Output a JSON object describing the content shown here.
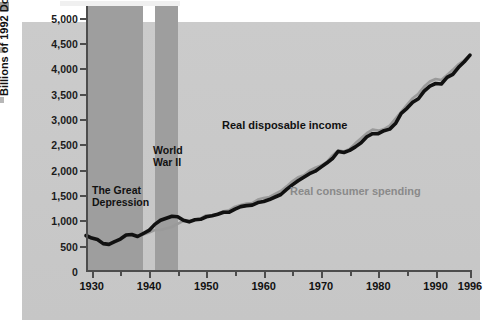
{
  "chart_data": {
    "type": "line",
    "title": "",
    "xlabel": "",
    "ylabel": "Billions of 1992 Dollars",
    "xlim": [
      1929,
      1996
    ],
    "ylim": [
      0,
      5250
    ],
    "grid": false,
    "legend_position": "inline-annotations",
    "y_ticks": [
      "0",
      "500",
      "1,000",
      "1,500",
      "2,000",
      "2,500",
      "3,000",
      "3,500",
      "4,000",
      "4,500",
      "5,000"
    ],
    "y_tick_values": [
      0,
      500,
      1000,
      1500,
      2000,
      2500,
      3000,
      3500,
      4000,
      4500,
      5000
    ],
    "x_ticks": [
      "1930",
      "1940",
      "1950",
      "1960",
      "1970",
      "1980",
      "1990",
      "1996"
    ],
    "x_tick_values": [
      1930,
      1940,
      1950,
      1960,
      1970,
      1980,
      1990,
      1996
    ],
    "x_minor_tick_values": [
      1935,
      1945,
      1955,
      1965,
      1975,
      1985
    ],
    "shaded_regions": [
      {
        "label": "The Great Depression",
        "start": 1929,
        "end": 1939,
        "color": "#9e9e9e"
      },
      {
        "label": "World War II",
        "start": 1941,
        "end": 1945,
        "color": "#9e9e9e"
      }
    ],
    "annotations": [
      {
        "text": "The Great\nDepression",
        "series": null
      },
      {
        "text": "World\nWar II",
        "series": null
      },
      {
        "text": "Real disposable income",
        "series": "Real disposable income"
      },
      {
        "text": "Real consumer spending",
        "series": "Real consumer spending"
      }
    ],
    "series": [
      {
        "name": "Real disposable income",
        "color": "#111111",
        "x": [
          1929,
          1930,
          1931,
          1932,
          1933,
          1934,
          1935,
          1936,
          1937,
          1938,
          1939,
          1940,
          1941,
          1942,
          1943,
          1944,
          1945,
          1946,
          1947,
          1948,
          1949,
          1950,
          1951,
          1952,
          1953,
          1954,
          1955,
          1956,
          1957,
          1958,
          1959,
          1960,
          1961,
          1962,
          1963,
          1964,
          1965,
          1966,
          1967,
          1968,
          1969,
          1970,
          1971,
          1972,
          1973,
          1974,
          1975,
          1976,
          1977,
          1978,
          1979,
          1980,
          1981,
          1982,
          1983,
          1984,
          1985,
          1986,
          1987,
          1988,
          1989,
          1990,
          1991,
          1992,
          1993,
          1994,
          1995,
          1996
        ],
        "y": [
          720,
          670,
          640,
          560,
          545,
          600,
          650,
          730,
          740,
          700,
          760,
          820,
          940,
          1020,
          1060,
          1100,
          1090,
          1020,
          990,
          1030,
          1040,
          1090,
          1110,
          1140,
          1180,
          1180,
          1240,
          1290,
          1310,
          1320,
          1370,
          1390,
          1430,
          1480,
          1530,
          1630,
          1720,
          1800,
          1870,
          1940,
          1990,
          2070,
          2150,
          2240,
          2380,
          2360,
          2400,
          2470,
          2550,
          2670,
          2730,
          2730,
          2790,
          2820,
          2930,
          3130,
          3230,
          3350,
          3420,
          3570,
          3670,
          3720,
          3710,
          3840,
          3900,
          4040,
          4150,
          4280
        ]
      },
      {
        "name": "Real consumer spending",
        "color": "#9a9a9a",
        "x": [
          1929,
          1930,
          1931,
          1932,
          1933,
          1934,
          1935,
          1936,
          1937,
          1938,
          1939,
          1940,
          1941,
          1942,
          1943,
          1944,
          1945,
          1946,
          1947,
          1948,
          1949,
          1950,
          1951,
          1952,
          1953,
          1954,
          1955,
          1956,
          1957,
          1958,
          1959,
          1960,
          1961,
          1962,
          1963,
          1964,
          1965,
          1966,
          1967,
          1968,
          1969,
          1970,
          1971,
          1972,
          1973,
          1974,
          1975,
          1976,
          1977,
          1978,
          1979,
          1980,
          1981,
          1982,
          1983,
          1984,
          1985,
          1986,
          1987,
          1988,
          1989,
          1990,
          1991,
          1992,
          1993,
          1994,
          1995,
          1996
        ],
        "y": [
          700,
          660,
          630,
          560,
          550,
          590,
          630,
          700,
          720,
          700,
          740,
          780,
          830,
          830,
          860,
          890,
          950,
          1010,
          1010,
          1030,
          1060,
          1120,
          1120,
          1150,
          1200,
          1220,
          1290,
          1320,
          1350,
          1360,
          1430,
          1460,
          1480,
          1540,
          1600,
          1690,
          1790,
          1870,
          1910,
          2000,
          2060,
          2100,
          2170,
          2300,
          2400,
          2380,
          2430,
          2540,
          2640,
          2740,
          2810,
          2790,
          2820,
          2890,
          3030,
          3160,
          3300,
          3430,
          3520,
          3660,
          3760,
          3810,
          3790,
          3890,
          3990,
          4100,
          4180,
          4280
        ]
      }
    ]
  },
  "annotations": {
    "depression_line1": "The Great",
    "depression_line2": "Depression",
    "ww2_line1": "World",
    "ww2_line2": "War II",
    "income_label": "Real disposable income",
    "spending_label": "Real consumer spending"
  },
  "axes": {
    "y_title": "Billions of 1992 Dollars"
  },
  "colors": {
    "panel_background": "#c9c9c9",
    "band": "#9e9e9e",
    "income_line": "#111111",
    "spending_line": "#9a9a9a",
    "axis": "#4d4d4d",
    "text": "#111111"
  }
}
